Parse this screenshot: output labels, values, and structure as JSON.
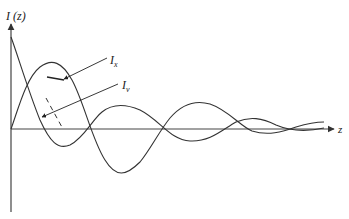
{
  "diagram": {
    "y_axis_label": "I (z)",
    "x_axis_label": "z",
    "curve_labels": {
      "ix": "I",
      "ix_sub": "x",
      "iv": "I",
      "iv_sub": "v"
    },
    "stroke_color": "#333333",
    "axis_color": "#444444",
    "background": "#ffffff"
  }
}
